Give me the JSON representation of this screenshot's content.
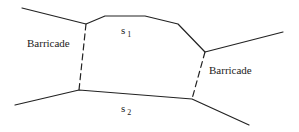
{
  "diagram": {
    "labels": {
      "barricade_left": "Barricade",
      "barricade_right": "Barricade",
      "s1_base": "s",
      "s1_sub": "1",
      "s2_base": "s",
      "s2_sub": "2"
    },
    "colors": {
      "line": "#222222",
      "background": "#ffffff"
    }
  }
}
